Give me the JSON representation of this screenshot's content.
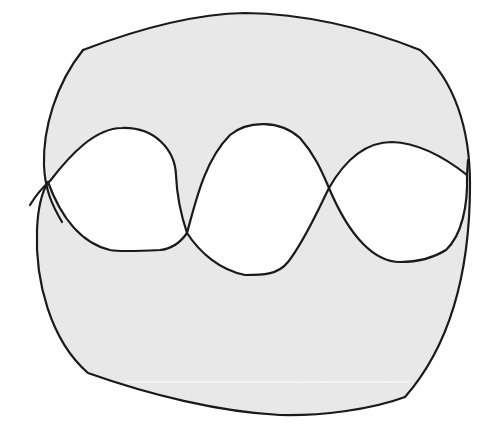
{
  "diagram": {
    "type": "topological figure",
    "colors": {
      "fill": "#e6e6e6",
      "stroke": "#1a1a1a",
      "lobe_fill": "#ffffff",
      "background": "#ffffff"
    },
    "regions": {
      "shaded_count": 1,
      "white_lobes": 3
    },
    "crossings": [
      {
        "x": 48,
        "y": 182
      },
      {
        "x": 187,
        "y": 233
      },
      {
        "x": 329,
        "y": 188
      },
      {
        "x": 468,
        "y": 184
      }
    ]
  }
}
